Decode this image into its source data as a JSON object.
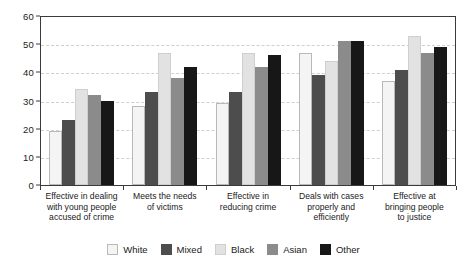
{
  "chart_data": {
    "type": "bar",
    "title": "",
    "xlabel": "",
    "ylabel": "",
    "ylim": [
      0,
      60
    ],
    "yticks": [
      0,
      10,
      20,
      30,
      40,
      50,
      60
    ],
    "grid": true,
    "legend_position": "bottom",
    "categories": [
      "Effective in dealing with young people accused of crime",
      "Meets the needs of victims",
      "Effective in reducing crime",
      "Deals with cases properly and efficiently",
      "Effective at bringing people to justice"
    ],
    "category_lines": [
      [
        "Effective in dealing",
        "with young people",
        "accused of crime"
      ],
      [
        "Meets the needs",
        "of victims"
      ],
      [
        "Effective in",
        "reducing crime"
      ],
      [
        "Deals with cases",
        "properly and",
        "efficiently"
      ],
      [
        "Effective at",
        "bringing people",
        "to justice"
      ]
    ],
    "series": [
      {
        "name": "White",
        "color": "#f4f4f4",
        "values": [
          19,
          28,
          29,
          47,
          37
        ]
      },
      {
        "name": "Mixed",
        "color": "#4d4d4d",
        "values": [
          23,
          33,
          33,
          39,
          41
        ]
      },
      {
        "name": "Black",
        "color": "#e2e2e2",
        "values": [
          34,
          47,
          47,
          44,
          53
        ]
      },
      {
        "name": "Asian",
        "color": "#8b8b8b",
        "values": [
          32,
          38,
          42,
          51,
          47
        ]
      },
      {
        "name": "Other",
        "color": "#171717",
        "values": [
          30,
          42,
          46,
          51,
          49
        ]
      }
    ]
  },
  "axis": {
    "tick_labels": [
      "0",
      "10",
      "20",
      "30",
      "40",
      "50",
      "60"
    ]
  },
  "legend": {
    "items": [
      {
        "label": "White"
      },
      {
        "label": "Mixed"
      },
      {
        "label": "Black"
      },
      {
        "label": "Asian"
      },
      {
        "label": "Other"
      }
    ]
  }
}
